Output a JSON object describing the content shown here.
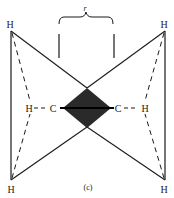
{
  "figure": {
    "caption": "(c)",
    "distance_label": "r",
    "colors": {
      "ink": "#1a1a1a",
      "diamond": "#2a2a2a",
      "background": "#ffffff"
    },
    "atoms": {
      "h_top_left": "H",
      "h_top_right": "H",
      "h_bottom_left": "H",
      "h_bottom_right": "H",
      "h_mid_left": "H",
      "h_mid_right": "H",
      "c_left": "C",
      "c_right": "C"
    }
  }
}
